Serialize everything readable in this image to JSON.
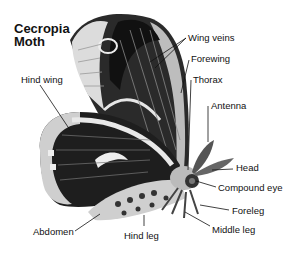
{
  "title": {
    "line1": "Cecropia",
    "line2": "Moth"
  },
  "labels": {
    "wing_veins": "Wing veins",
    "forewing": "Forewing",
    "thorax": "Thorax",
    "hind_wing": "Hind wing",
    "antenna": "Antenna",
    "head": "Head",
    "compound_eye": "Compound eye",
    "foreleg": "Foreleg",
    "abdomen": "Abdomen",
    "hind_leg": "Hind leg",
    "middle_leg": "Middle leg"
  },
  "colors": {
    "ink": "#111111",
    "wing_dark": "#1a1a1a",
    "wing_light": "#d8d8d8",
    "band": "#f2f2f2"
  }
}
